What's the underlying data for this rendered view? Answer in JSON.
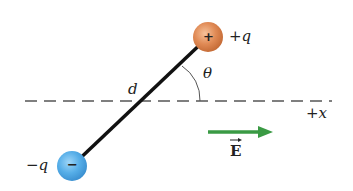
{
  "diagram": {
    "positive_charge": {
      "label": "+q",
      "sign": "+",
      "color": "#d9844f"
    },
    "negative_charge": {
      "label": "−q",
      "sign": "−",
      "color": "#56aee8"
    },
    "separation_label": "d",
    "angle_label": "θ",
    "axis_label": "+x",
    "field_label": "E",
    "field_arrow_color": "#3a9a44"
  }
}
